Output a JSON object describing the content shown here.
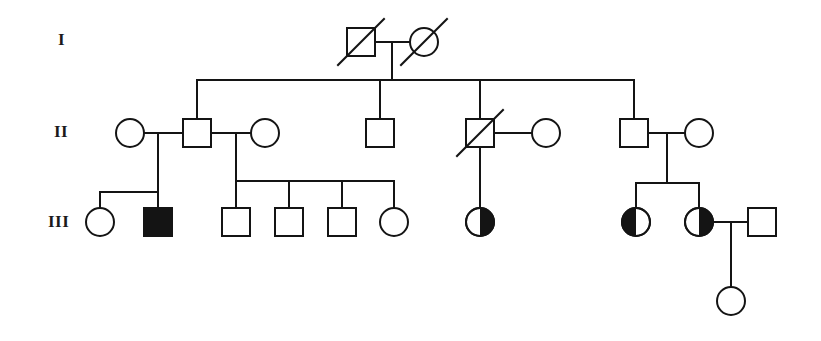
{
  "diagram": {
    "kind": "pedigree-chart",
    "width": 821,
    "height": 341,
    "stroke_color": "#141414",
    "fill_color": "#141414",
    "background_color": "#ffffff",
    "stroke_width": 2,
    "symbol_size": 28
  },
  "generation_labels": [
    {
      "id": "gen-label-I",
      "text": "I",
      "x": 58,
      "y": 30
    },
    {
      "id": "gen-label-II",
      "text": "II",
      "x": 54,
      "y": 122
    },
    {
      "id": "gen-label-III",
      "text": "III",
      "x": 48,
      "y": 212
    }
  ],
  "legend": {
    "shapes": {
      "square": "male",
      "circle": "female"
    },
    "fills": {
      "none": "unaffected",
      "full": "affected",
      "half-left": "carrier-half-filled-left",
      "half-right": "carrier-half-filled-right"
    },
    "slash": "deceased"
  },
  "generations": {
    "I": {
      "label": "I",
      "y": 42,
      "members": [
        {
          "id": "I-1",
          "sex": "male",
          "fill": "none",
          "deceased": true,
          "x": 361,
          "y": 42,
          "affected": false
        },
        {
          "id": "I-2",
          "sex": "female",
          "fill": "none",
          "deceased": true,
          "x": 424,
          "y": 42,
          "affected": false
        }
      ]
    },
    "II": {
      "label": "II",
      "y": 133,
      "members": [
        {
          "id": "II-1",
          "sex": "female",
          "fill": "none",
          "deceased": false,
          "x": 130,
          "y": 133,
          "affected": false
        },
        {
          "id": "II-2",
          "sex": "male",
          "fill": "none",
          "deceased": false,
          "x": 197,
          "y": 133,
          "affected": false
        },
        {
          "id": "II-3",
          "sex": "female",
          "fill": "none",
          "deceased": false,
          "x": 265,
          "y": 133,
          "affected": false
        },
        {
          "id": "II-4",
          "sex": "male",
          "fill": "none",
          "deceased": false,
          "x": 380,
          "y": 133,
          "affected": false
        },
        {
          "id": "II-5",
          "sex": "male",
          "fill": "none",
          "deceased": true,
          "x": 480,
          "y": 133,
          "affected": false
        },
        {
          "id": "II-6",
          "sex": "female",
          "fill": "none",
          "deceased": false,
          "x": 546,
          "y": 133,
          "affected": false
        },
        {
          "id": "II-7",
          "sex": "male",
          "fill": "none",
          "deceased": false,
          "x": 634,
          "y": 133,
          "affected": false
        },
        {
          "id": "II-8",
          "sex": "female",
          "fill": "none",
          "deceased": false,
          "x": 699,
          "y": 133,
          "affected": false
        }
      ]
    },
    "III": {
      "label": "III",
      "y": 222,
      "members": [
        {
          "id": "III-1",
          "sex": "female",
          "fill": "none",
          "deceased": false,
          "x": 100,
          "y": 222,
          "affected": false
        },
        {
          "id": "III-2",
          "sex": "male",
          "fill": "full",
          "deceased": false,
          "x": 158,
          "y": 222,
          "affected": true
        },
        {
          "id": "III-3",
          "sex": "male",
          "fill": "none",
          "deceased": false,
          "x": 236,
          "y": 222,
          "affected": false
        },
        {
          "id": "III-4",
          "sex": "male",
          "fill": "none",
          "deceased": false,
          "x": 289,
          "y": 222,
          "affected": false
        },
        {
          "id": "III-5",
          "sex": "male",
          "fill": "none",
          "deceased": false,
          "x": 342,
          "y": 222,
          "affected": false
        },
        {
          "id": "III-6",
          "sex": "female",
          "fill": "none",
          "deceased": false,
          "x": 394,
          "y": 222,
          "affected": false
        },
        {
          "id": "III-7",
          "sex": "female",
          "fill": "half-right",
          "deceased": false,
          "x": 480,
          "y": 222,
          "affected": true
        },
        {
          "id": "III-8",
          "sex": "female",
          "fill": "half-left",
          "deceased": false,
          "x": 636,
          "y": 222,
          "affected": true
        },
        {
          "id": "III-9",
          "sex": "female",
          "fill": "half-right",
          "deceased": false,
          "x": 699,
          "y": 222,
          "affected": true
        },
        {
          "id": "III-10",
          "sex": "male",
          "fill": "none",
          "deceased": false,
          "x": 762,
          "y": 222,
          "affected": false
        }
      ]
    },
    "IV": {
      "label": "",
      "y": 301,
      "members": [
        {
          "id": "IV-1",
          "sex": "female",
          "fill": "none",
          "deceased": false,
          "x": 731,
          "y": 301,
          "affected": false
        }
      ]
    }
  },
  "unions": [
    {
      "id": "union-I",
      "partners": [
        "I-1",
        "I-2"
      ],
      "mating_y": 42,
      "x1": 375,
      "x2": 410,
      "drop_x": 392,
      "drop_to": 80
    },
    {
      "id": "union-II-a",
      "partners": [
        "II-1",
        "II-2"
      ],
      "mating_y": 133,
      "x1": 144,
      "x2": 183,
      "drop_x": 158,
      "drop_to": 192
    },
    {
      "id": "union-II-b",
      "partners": [
        "II-2",
        "II-3"
      ],
      "mating_y": 133,
      "x1": 211,
      "x2": 251,
      "drop_x": 236,
      "drop_to": 181
    },
    {
      "id": "union-II-c",
      "partners": [
        "II-5",
        "II-6"
      ],
      "mating_y": 133,
      "x1": 494,
      "x2": 532,
      "drop_x": 480,
      "drop_to": 208
    },
    {
      "id": "union-II-d",
      "partners": [
        "II-7",
        "II-8"
      ],
      "mating_y": 133,
      "x1": 648,
      "x2": 685,
      "drop_x": 667,
      "drop_to": 183
    },
    {
      "id": "union-III-a",
      "partners": [
        "III-9",
        "III-10"
      ],
      "mating_y": 222,
      "x1": 713,
      "x2": 748,
      "drop_x": 731,
      "drop_to": 287
    }
  ],
  "sibships": [
    {
      "id": "sibship-I-offspring",
      "parent_union": "union-I",
      "line_y": 80,
      "x_left": 197,
      "x_right": 634,
      "children": [
        "II-2",
        "II-4",
        "II-5",
        "II-7"
      ],
      "child_x": [
        197,
        380,
        480,
        634
      ],
      "child_top": 119
    },
    {
      "id": "sibship-II-a-offspring",
      "parent_union": "union-II-a",
      "line_y": 192,
      "x_left": 100,
      "x_right": 158,
      "children": [
        "III-1",
        "III-2"
      ],
      "child_x": [
        100,
        158
      ],
      "child_top": 208
    },
    {
      "id": "sibship-II-b-offspring",
      "parent_union": "union-II-b",
      "line_y": 181,
      "x_left": 236,
      "x_right": 394,
      "children": [
        "III-3",
        "III-4",
        "III-5",
        "III-6"
      ],
      "child_x": [
        236,
        289,
        342,
        394
      ],
      "child_top": 208
    },
    {
      "id": "sibship-II-c-offspring",
      "parent_union": "union-II-c",
      "line_y": 208,
      "x_left": 480,
      "x_right": 480,
      "children": [
        "III-7"
      ],
      "child_x": [
        480
      ],
      "child_top": 208
    },
    {
      "id": "sibship-II-d-offspring",
      "parent_union": "union-II-d",
      "line_y": 183,
      "x_left": 636,
      "x_right": 699,
      "children": [
        "III-8",
        "III-9"
      ],
      "child_x": [
        636,
        699
      ],
      "child_top": 208
    },
    {
      "id": "sibship-III-a-offspring",
      "parent_union": "union-III-a",
      "line_y": 287,
      "x_left": 731,
      "x_right": 731,
      "children": [
        "IV-1"
      ],
      "child_x": [
        731
      ],
      "child_top": 287
    }
  ]
}
